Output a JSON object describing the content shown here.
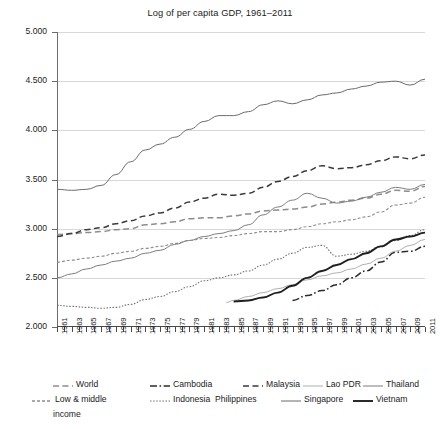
{
  "chart_data": {
    "type": "line",
    "title": "Log of per capita GDP, 1961–2011",
    "xlabel": "",
    "ylabel": "",
    "xlim": [
      1961,
      2011
    ],
    "ylim": [
      2.0,
      5.0
    ],
    "grid": true,
    "legend_position": "bottom",
    "yticks": [
      "2.000",
      "2.500",
      "3.000",
      "3.500",
      "4.000",
      "4.500",
      "5.000"
    ],
    "ytick_values": [
      2.0,
      2.5,
      3.0,
      3.5,
      4.0,
      4.5,
      5.0
    ],
    "xticks": [
      "1961",
      "1963",
      "1965",
      "1967",
      "1969",
      "1971",
      "1973",
      "1975",
      "1977",
      "1979",
      "1981",
      "1983",
      "1985",
      "1987",
      "1989",
      "1991",
      "1993",
      "1995",
      "1997",
      "1999",
      "2001",
      "2003",
      "2005",
      "2007",
      "2009",
      "2011"
    ],
    "xtick_values": [
      1961,
      1963,
      1965,
      1967,
      1969,
      1971,
      1973,
      1975,
      1977,
      1979,
      1981,
      1983,
      1985,
      1987,
      1989,
      1991,
      1993,
      1995,
      1997,
      1999,
      2001,
      2003,
      2005,
      2007,
      2009,
      2011
    ],
    "series": [
      {
        "name": "World",
        "style": "dashed",
        "color": "#8c8c8c",
        "x": [
          1961,
          1963,
          1965,
          1967,
          1969,
          1971,
          1973,
          1975,
          1977,
          1979,
          1981,
          1983,
          1985,
          1987,
          1989,
          1991,
          1993,
          1995,
          1997,
          1999,
          2001,
          2003,
          2005,
          2007,
          2009,
          2011
        ],
        "values": [
          2.94,
          2.95,
          2.96,
          2.97,
          2.99,
          3.0,
          3.04,
          3.05,
          3.07,
          3.1,
          3.11,
          3.11,
          3.13,
          3.15,
          3.18,
          3.19,
          3.2,
          3.22,
          3.25,
          3.27,
          3.29,
          3.31,
          3.35,
          3.39,
          3.38,
          3.43
        ]
      },
      {
        "name": "Cambodia",
        "style": "dash-dot",
        "color": "#2b2b2b",
        "x": [
          1993,
          1995,
          1997,
          1999,
          2001,
          2003,
          2005,
          2007,
          2009,
          2011
        ],
        "values": [
          2.27,
          2.32,
          2.37,
          2.43,
          2.5,
          2.57,
          2.66,
          2.76,
          2.77,
          2.82
        ]
      },
      {
        "name": "Malaysia",
        "style": "dashed",
        "color": "#3a3a3a",
        "x": [
          1961,
          1963,
          1965,
          1967,
          1969,
          1971,
          1973,
          1975,
          1977,
          1979,
          1981,
          1983,
          1985,
          1987,
          1989,
          1991,
          1993,
          1995,
          1997,
          1999,
          2001,
          2003,
          2005,
          2007,
          2009,
          2011
        ],
        "values": [
          2.92,
          2.95,
          2.99,
          3.01,
          3.05,
          3.08,
          3.13,
          3.16,
          3.21,
          3.27,
          3.31,
          3.35,
          3.34,
          3.36,
          3.42,
          3.48,
          3.53,
          3.59,
          3.64,
          3.61,
          3.62,
          3.65,
          3.69,
          3.73,
          3.71,
          3.75
        ]
      },
      {
        "name": "Lao PDR",
        "style": "solid-thin",
        "color": "#9a9a9a",
        "x": [
          1984,
          1985,
          1987,
          1989,
          1991,
          1993,
          1995,
          1997,
          1999,
          2001,
          2003,
          2005,
          2007,
          2009,
          2011
        ],
        "values": [
          2.25,
          2.27,
          2.31,
          2.35,
          2.39,
          2.43,
          2.48,
          2.52,
          2.55,
          2.59,
          2.64,
          2.7,
          2.77,
          2.83,
          2.89
        ]
      },
      {
        "name": "Thailand",
        "style": "solid",
        "color": "#7d7d7d",
        "x": [
          1961,
          1963,
          1965,
          1967,
          1969,
          1971,
          1973,
          1975,
          1977,
          1979,
          1981,
          1983,
          1985,
          1987,
          1989,
          1991,
          1993,
          1995,
          1997,
          1999,
          2001,
          2003,
          2005,
          2007,
          2009,
          2011
        ],
        "values": [
          2.5,
          2.54,
          2.59,
          2.63,
          2.67,
          2.7,
          2.75,
          2.78,
          2.84,
          2.88,
          2.92,
          2.95,
          2.98,
          3.04,
          3.14,
          3.22,
          3.29,
          3.36,
          3.31,
          3.26,
          3.28,
          3.32,
          3.37,
          3.42,
          3.4,
          3.45
        ]
      },
      {
        "name": "Low & middle income",
        "style": "dotted-dash",
        "color": "#8c8c8c",
        "x": [
          1961,
          1963,
          1965,
          1967,
          1969,
          1971,
          1973,
          1975,
          1977,
          1979,
          1981,
          1983,
          1985,
          1987,
          1989,
          1991,
          1993,
          1995,
          1997,
          1999,
          2001,
          2003,
          2005,
          2007,
          2009,
          2011
        ],
        "values": [
          2.66,
          2.68,
          2.7,
          2.72,
          2.75,
          2.77,
          2.8,
          2.82,
          2.85,
          2.88,
          2.9,
          2.91,
          2.93,
          2.95,
          2.97,
          2.97,
          2.99,
          3.02,
          3.05,
          3.07,
          3.09,
          3.12,
          3.17,
          3.24,
          3.26,
          3.32
        ]
      },
      {
        "name": "Indonesia",
        "style": "dotted",
        "color": "#6f6f6f",
        "x": [
          1961,
          1963,
          1965,
          1967,
          1969,
          1971,
          1973,
          1975,
          1977,
          1979,
          1981,
          1983,
          1985,
          1987,
          1989,
          1991,
          1993,
          1995,
          1997,
          1999,
          2001,
          2003,
          2005,
          2007,
          2009,
          2011
        ],
        "values": [
          2.22,
          2.21,
          2.2,
          2.19,
          2.2,
          2.23,
          2.28,
          2.31,
          2.36,
          2.41,
          2.47,
          2.5,
          2.53,
          2.57,
          2.63,
          2.69,
          2.75,
          2.81,
          2.83,
          2.72,
          2.74,
          2.77,
          2.82,
          2.88,
          2.93,
          2.99
        ]
      },
      {
        "name": "Philippines",
        "style": "none",
        "color": "#6f6f6f",
        "x": [],
        "values": []
      },
      {
        "name": "Singapore",
        "style": "solid",
        "color": "#6b6b6b",
        "x": [
          1961,
          1963,
          1965,
          1967,
          1969,
          1971,
          1973,
          1975,
          1977,
          1979,
          1981,
          1983,
          1985,
          1987,
          1989,
          1991,
          1993,
          1995,
          1997,
          1999,
          2001,
          2003,
          2005,
          2007,
          2009,
          2011
        ],
        "values": [
          3.4,
          3.39,
          3.4,
          3.44,
          3.55,
          3.68,
          3.8,
          3.86,
          3.93,
          4.01,
          4.09,
          4.15,
          4.15,
          4.19,
          4.26,
          4.3,
          4.27,
          4.31,
          4.36,
          4.38,
          4.42,
          4.45,
          4.49,
          4.5,
          4.46,
          4.52
        ]
      },
      {
        "name": "Vietnam",
        "style": "solid-thick",
        "color": "#1f1f1f",
        "x": [
          1985,
          1987,
          1989,
          1991,
          1993,
          1995,
          1997,
          1999,
          2001,
          2003,
          2005,
          2007,
          2009,
          2011
        ],
        "values": [
          2.26,
          2.27,
          2.3,
          2.35,
          2.42,
          2.5,
          2.57,
          2.63,
          2.69,
          2.75,
          2.82,
          2.89,
          2.92,
          2.96
        ]
      }
    ]
  },
  "legend": {
    "row1": [
      {
        "label": "World",
        "style": "dashed"
      },
      {
        "label": "Cambodia",
        "style": "dash-dot"
      },
      {
        "label": "Malaysia",
        "style": "dashed"
      },
      {
        "label": "Lao PDR",
        "style": "solid-thin"
      },
      {
        "label": "Thailand",
        "style": "solid"
      }
    ],
    "row2": [
      {
        "label": "Low & middle",
        "style": "dotted-dash"
      },
      {
        "label": "Indonesia",
        "style": "dotted"
      },
      {
        "label": "Philippines",
        "style": "none"
      },
      {
        "label": "Singapore",
        "style": "solid"
      },
      {
        "label": "Vietnam",
        "style": "solid-thick"
      }
    ],
    "row2_continuation": "income"
  },
  "colors": {
    "grid": "#d8d8d8",
    "axis": "#4a4a4a",
    "text": "#1b1b1b",
    "background": "#ffffff"
  }
}
